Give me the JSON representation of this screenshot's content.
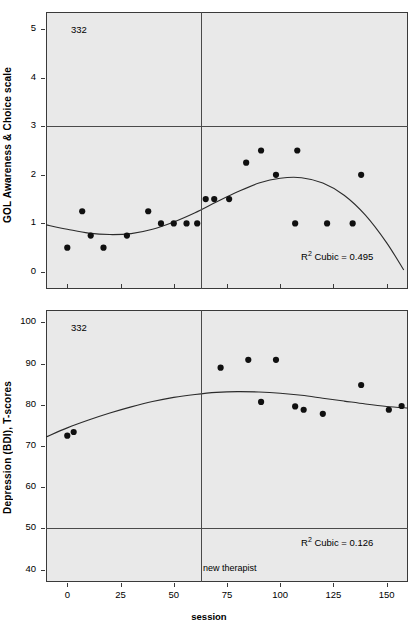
{
  "figure": {
    "case_id": "332",
    "event_line_label": "new therapist"
  },
  "chart_data": [
    {
      "type": "scatter",
      "panel": "top",
      "title": "",
      "case_id": "332",
      "xlabel": "",
      "ylabel": "GOL Awareness & Choice scale",
      "xlim": [
        -10,
        160
      ],
      "ylim": [
        -0.35,
        5.35
      ],
      "xticks": [
        0,
        25,
        50,
        75,
        100,
        125,
        150
      ],
      "yticks": [
        0,
        1,
        2,
        3,
        4,
        5
      ],
      "grid": false,
      "annotation": "R² Cubic = 0.495",
      "r2_cubic": 0.495,
      "reference_hline": 3,
      "event_vline": 63,
      "event_vline_label": "",
      "points": [
        {
          "x": 0,
          "y": 0.5
        },
        {
          "x": 7,
          "y": 1.25
        },
        {
          "x": 11,
          "y": 0.75
        },
        {
          "x": 17,
          "y": 0.5
        },
        {
          "x": 28,
          "y": 0.75
        },
        {
          "x": 38,
          "y": 1.25
        },
        {
          "x": 44,
          "y": 1.0
        },
        {
          "x": 50,
          "y": 1.0
        },
        {
          "x": 56,
          "y": 1.0
        },
        {
          "x": 61,
          "y": 1.0
        },
        {
          "x": 65,
          "y": 1.5
        },
        {
          "x": 69,
          "y": 1.5
        },
        {
          "x": 76,
          "y": 1.5
        },
        {
          "x": 84,
          "y": 2.25
        },
        {
          "x": 91,
          "y": 2.5
        },
        {
          "x": 98,
          "y": 2.0
        },
        {
          "x": 108,
          "y": 2.5
        },
        {
          "x": 107,
          "y": 1.0
        },
        {
          "x": 122,
          "y": 1.0
        },
        {
          "x": 134,
          "y": 1.0
        },
        {
          "x": 138,
          "y": 2.0
        }
      ],
      "fit_curve": [
        {
          "x": -10,
          "y": 0.97
        },
        {
          "x": 0,
          "y": 0.88
        },
        {
          "x": 10,
          "y": 0.8
        },
        {
          "x": 20,
          "y": 0.77
        },
        {
          "x": 30,
          "y": 0.79
        },
        {
          "x": 40,
          "y": 0.88
        },
        {
          "x": 50,
          "y": 1.03
        },
        {
          "x": 60,
          "y": 1.22
        },
        {
          "x": 70,
          "y": 1.44
        },
        {
          "x": 80,
          "y": 1.65
        },
        {
          "x": 90,
          "y": 1.83
        },
        {
          "x": 100,
          "y": 1.93
        },
        {
          "x": 110,
          "y": 1.94
        },
        {
          "x": 120,
          "y": 1.83
        },
        {
          "x": 130,
          "y": 1.58
        },
        {
          "x": 140,
          "y": 1.17
        },
        {
          "x": 150,
          "y": 0.6
        },
        {
          "x": 158,
          "y": 0.04
        }
      ]
    },
    {
      "type": "scatter",
      "panel": "bottom",
      "title": "",
      "case_id": "332",
      "xlabel": "session",
      "ylabel": "Depression (BDI), T-scores",
      "xlim": [
        -10,
        160
      ],
      "ylim": [
        37,
        103
      ],
      "xticks": [
        0,
        25,
        50,
        75,
        100,
        125,
        150
      ],
      "yticks": [
        40,
        50,
        60,
        70,
        80,
        90,
        100
      ],
      "grid": false,
      "annotation": "R² Cubic = 0.126",
      "r2_cubic": 0.126,
      "reference_hline": 50,
      "event_vline": 63,
      "event_vline_label": "new therapist",
      "points": [
        {
          "x": 0,
          "y": 72.5
        },
        {
          "x": 3,
          "y": 73.4
        },
        {
          "x": 72,
          "y": 89.0
        },
        {
          "x": 85,
          "y": 90.9
        },
        {
          "x": 98,
          "y": 90.9
        },
        {
          "x": 91,
          "y": 80.7
        },
        {
          "x": 107,
          "y": 79.6
        },
        {
          "x": 111,
          "y": 78.8
        },
        {
          "x": 120,
          "y": 77.8
        },
        {
          "x": 138,
          "y": 84.8
        },
        {
          "x": 151,
          "y": 78.8
        },
        {
          "x": 157,
          "y": 79.7
        }
      ],
      "fit_curve": [
        {
          "x": -10,
          "y": 72.2
        },
        {
          "x": 0,
          "y": 74.4
        },
        {
          "x": 10,
          "y": 76.3
        },
        {
          "x": 20,
          "y": 78.0
        },
        {
          "x": 30,
          "y": 79.5
        },
        {
          "x": 40,
          "y": 80.8
        },
        {
          "x": 50,
          "y": 81.8
        },
        {
          "x": 60,
          "y": 82.5
        },
        {
          "x": 70,
          "y": 83.0
        },
        {
          "x": 80,
          "y": 83.2
        },
        {
          "x": 90,
          "y": 83.1
        },
        {
          "x": 100,
          "y": 82.8
        },
        {
          "x": 110,
          "y": 82.3
        },
        {
          "x": 120,
          "y": 81.6
        },
        {
          "x": 130,
          "y": 80.9
        },
        {
          "x": 140,
          "y": 80.2
        },
        {
          "x": 150,
          "y": 79.6
        },
        {
          "x": 160,
          "y": 79.2
        }
      ]
    }
  ]
}
